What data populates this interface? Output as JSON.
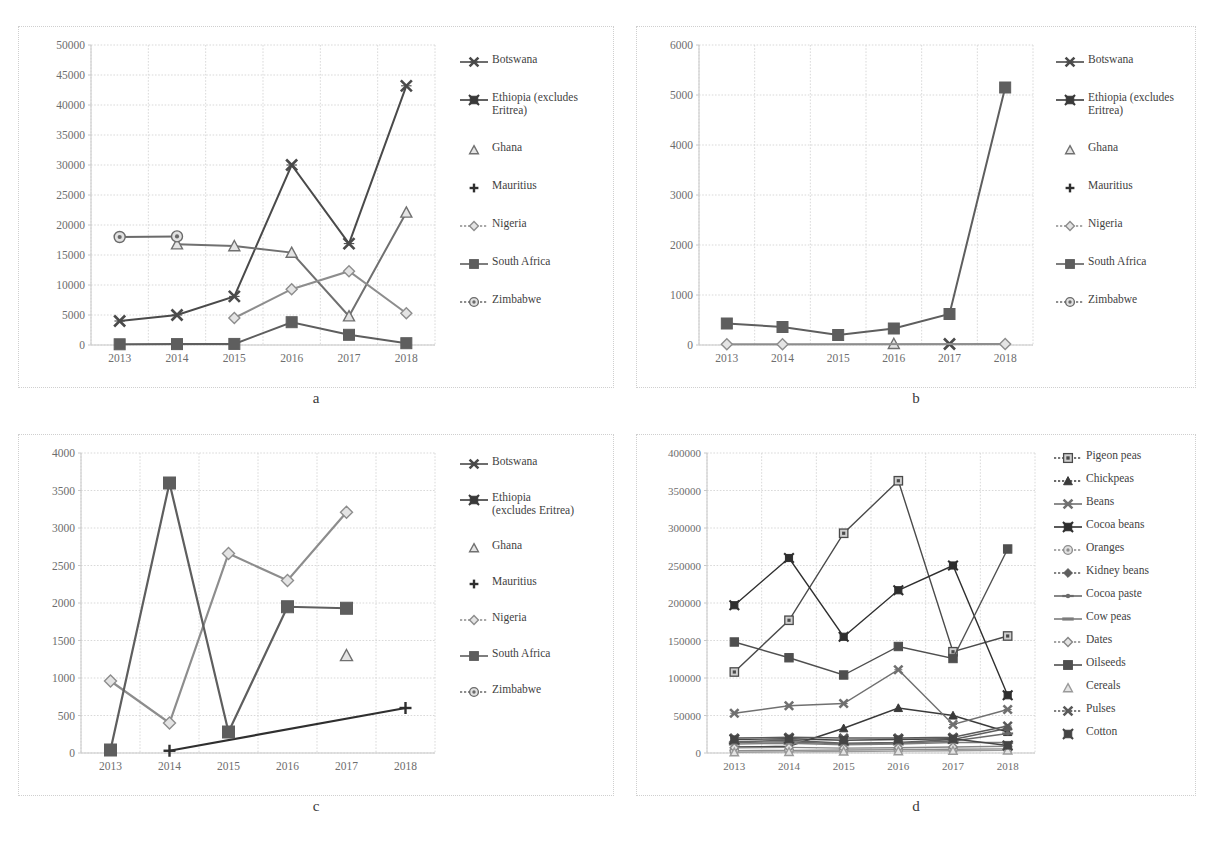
{
  "figure": {
    "panels": [
      {
        "id": "a",
        "caption": "a",
        "chart_data": {
          "type": "line",
          "title": "",
          "xlabel": "",
          "ylabel": "",
          "categories": [
            "2013",
            "2014",
            "2015",
            "2016",
            "2017",
            "2018"
          ],
          "ylim": [
            0,
            50000
          ],
          "yticks": [
            0,
            5000,
            10000,
            15000,
            20000,
            25000,
            30000,
            35000,
            40000,
            45000,
            50000
          ],
          "ytick_labels": [
            "0",
            "5000",
            "10000",
            "15000",
            "20000",
            "25000",
            "30000",
            "35000",
            "40000",
            "45000",
            "50000"
          ],
          "grid": true,
          "legend_position": "right",
          "series": [
            {
              "name": "Botswana",
              "marker": "star-x",
              "values": [
                4000,
                5000,
                8100,
                30000,
                16900,
                43200
              ]
            },
            {
              "name": "Ethiopia (excludes Eritrea)",
              "marker": "star-box",
              "values": [
                null,
                null,
                null,
                null,
                null,
                null
              ]
            },
            {
              "name": "Ghana",
              "marker": "triangle",
              "values": [
                null,
                16800,
                16500,
                15400,
                4800,
                22100
              ]
            },
            {
              "name": "Mauritius",
              "marker": "plus",
              "values": [
                null,
                null,
                null,
                null,
                null,
                null
              ]
            },
            {
              "name": "Nigeria",
              "marker": "diamond",
              "values": [
                null,
                null,
                4500,
                9300,
                12300,
                5300
              ]
            },
            {
              "name": "South Africa",
              "marker": "square",
              "values": [
                120,
                150,
                180,
                3800,
                1700,
                300
              ]
            },
            {
              "name": "Zimbabwe",
              "marker": "circle",
              "values": [
                18000,
                18100,
                null,
                null,
                null,
                null
              ]
            }
          ]
        },
        "legend": [
          {
            "label": "Botswana",
            "marker": "star-x"
          },
          {
            "label": "Ethiopia (excludes\nEritrea)",
            "marker": "star-box"
          },
          {
            "label": "Ghana",
            "marker": "triangle"
          },
          {
            "label": "Mauritius",
            "marker": "plus"
          },
          {
            "label": "Nigeria",
            "marker": "diamond"
          },
          {
            "label": "South Africa",
            "marker": "square"
          },
          {
            "label": "Zimbabwe",
            "marker": "circle"
          }
        ]
      },
      {
        "id": "b",
        "caption": "b",
        "chart_data": {
          "type": "line",
          "title": "",
          "xlabel": "",
          "ylabel": "",
          "categories": [
            "2013",
            "2014",
            "2015",
            "2016",
            "2017",
            "2018"
          ],
          "ylim": [
            0,
            6000
          ],
          "yticks": [
            0,
            1000,
            2000,
            3000,
            4000,
            5000,
            6000
          ],
          "ytick_labels": [
            "0",
            "1000",
            "2000",
            "3000",
            "4000",
            "5000",
            "6000"
          ],
          "grid": true,
          "legend_position": "right",
          "series": [
            {
              "name": "Botswana",
              "marker": "star-x",
              "values": [
                null,
                null,
                null,
                null,
                20,
                null
              ]
            },
            {
              "name": "Ethiopia (excludes Eritrea)",
              "marker": "star-box",
              "values": [
                null,
                null,
                null,
                null,
                null,
                null
              ]
            },
            {
              "name": "Ghana",
              "marker": "triangle",
              "values": [
                null,
                null,
                null,
                25,
                null,
                null
              ]
            },
            {
              "name": "Mauritius",
              "marker": "plus",
              "values": [
                null,
                null,
                null,
                null,
                null,
                null
              ]
            },
            {
              "name": "Nigeria",
              "marker": "diamond",
              "values": [
                15,
                15,
                null,
                null,
                null,
                20
              ]
            },
            {
              "name": "South Africa",
              "marker": "square",
              "values": [
                430,
                360,
                200,
                330,
                620,
                5150
              ]
            },
            {
              "name": "Zimbabwe",
              "marker": "circle",
              "values": [
                null,
                null,
                null,
                null,
                null,
                null
              ]
            }
          ]
        },
        "legend": [
          {
            "label": "Botswana",
            "marker": "star-x"
          },
          {
            "label": "Ethiopia (excludes\nEritrea)",
            "marker": "star-box"
          },
          {
            "label": "Ghana",
            "marker": "triangle"
          },
          {
            "label": "Mauritius",
            "marker": "plus"
          },
          {
            "label": "Nigeria",
            "marker": "diamond"
          },
          {
            "label": "South Africa",
            "marker": "square"
          },
          {
            "label": "Zimbabwe",
            "marker": "circle"
          }
        ]
      },
      {
        "id": "c",
        "caption": "c",
        "chart_data": {
          "type": "line",
          "title": "",
          "xlabel": "",
          "ylabel": "",
          "categories": [
            "2013",
            "2014",
            "2015",
            "2016",
            "2017",
            "2018"
          ],
          "ylim": [
            0,
            4000
          ],
          "yticks": [
            0,
            500,
            1000,
            1500,
            2000,
            2500,
            3000,
            3500,
            4000
          ],
          "ytick_labels": [
            "0",
            "500",
            "1000",
            "1500",
            "2000",
            "2500",
            "3000",
            "3500",
            "4000"
          ],
          "grid": true,
          "legend_position": "right",
          "series": [
            {
              "name": "Botswana",
              "marker": "star-x",
              "values": [
                null,
                null,
                null,
                null,
                null,
                null
              ]
            },
            {
              "name": "Ethiopia (excludes Eritrea)",
              "marker": "star-box",
              "values": [
                null,
                null,
                null,
                null,
                null,
                null
              ]
            },
            {
              "name": "Ghana",
              "marker": "triangle",
              "values": [
                null,
                null,
                null,
                null,
                1300,
                null
              ]
            },
            {
              "name": "Mauritius",
              "marker": "plus",
              "values": [
                null,
                30,
                null,
                null,
                null,
                600
              ]
            },
            {
              "name": "Nigeria",
              "marker": "diamond",
              "values": [
                960,
                400,
                2660,
                2300,
                3210,
                null
              ]
            },
            {
              "name": "South Africa",
              "marker": "square",
              "values": [
                40,
                3600,
                280,
                1950,
                1930,
                null
              ]
            },
            {
              "name": "Zimbabwe",
              "marker": "circle",
              "values": [
                null,
                null,
                null,
                null,
                null,
                null
              ]
            }
          ]
        },
        "legend": [
          {
            "label": "Botswana",
            "marker": "star-x"
          },
          {
            "label": "Ethiopia\n(excludes Eritrea)",
            "marker": "star-box"
          },
          {
            "label": "Ghana",
            "marker": "triangle"
          },
          {
            "label": "Mauritius",
            "marker": "plus"
          },
          {
            "label": "Nigeria",
            "marker": "diamond"
          },
          {
            "label": "South Africa",
            "marker": "square"
          },
          {
            "label": "Zimbabwe",
            "marker": "circle"
          }
        ]
      },
      {
        "id": "d",
        "caption": "d",
        "chart_data": {
          "type": "line",
          "title": "",
          "xlabel": "",
          "ylabel": "",
          "categories": [
            "2013",
            "2014",
            "2015",
            "2016",
            "2017",
            "2018"
          ],
          "ylim": [
            0,
            400000
          ],
          "yticks": [
            0,
            50000,
            100000,
            150000,
            200000,
            250000,
            300000,
            350000,
            400000
          ],
          "ytick_labels": [
            "0",
            "50000",
            "100000",
            "150000",
            "200000",
            "250000",
            "300000",
            "350000",
            "400000"
          ],
          "grid": true,
          "legend_position": "right",
          "series": [
            {
              "name": "Pigeon peas",
              "marker": "square-dot",
              "values": [
                108000,
                177000,
                293000,
                363000,
                135000,
                156000
              ]
            },
            {
              "name": "Chickpeas",
              "marker": "triangle-fill",
              "values": [
                8000,
                9000,
                33000,
                60000,
                50000,
                28000
              ]
            },
            {
              "name": "Beans",
              "marker": "star-x",
              "values": [
                53000,
                63000,
                66000,
                111000,
                38000,
                58000
              ]
            },
            {
              "name": "Cocoa beans",
              "marker": "star-box",
              "values": [
                197000,
                260000,
                155000,
                217000,
                250000,
                77000
              ]
            },
            {
              "name": "Oranges",
              "marker": "circle",
              "values": [
                3000,
                3500,
                4000,
                4500,
                5000,
                5500
              ]
            },
            {
              "name": "Kidney beans",
              "marker": "diamond-fill",
              "values": [
                15000,
                17000,
                13000,
                14000,
                18000,
                33000
              ]
            },
            {
              "name": "Cocoa paste",
              "marker": "dash-fill",
              "values": [
                14000,
                15000,
                12000,
                13000,
                16000,
                26000
              ]
            },
            {
              "name": "Cow peas",
              "marker": "dash",
              "values": [
                12000,
                13000,
                11000,
                12000,
                14000,
                14000
              ]
            },
            {
              "name": "Dates",
              "marker": "diamond",
              "values": [
                7000,
                7500,
                6500,
                7000,
                8000,
                9000
              ]
            },
            {
              "name": "Oilseeds",
              "marker": "square",
              "values": [
                148000,
                127000,
                104000,
                142000,
                126000,
                272000
              ]
            },
            {
              "name": "Cereals",
              "marker": "triangle",
              "values": [
                1000,
                1500,
                2000,
                2500,
                3000,
                3500
              ]
            },
            {
              "name": "Pulses",
              "marker": "star-x2",
              "values": [
                20000,
                21000,
                20000,
                20000,
                21000,
                36000
              ]
            },
            {
              "name": "Cotton",
              "marker": "star-box2",
              "values": [
                18000,
                19000,
                17000,
                18000,
                19000,
                10000
              ]
            }
          ]
        },
        "legend": [
          {
            "label": "Pigeon peas",
            "marker": "square-dot"
          },
          {
            "label": "Chickpeas",
            "marker": "triangle-fill"
          },
          {
            "label": "Beans",
            "marker": "star-x"
          },
          {
            "label": "Cocoa beans",
            "marker": "star-box"
          },
          {
            "label": "Oranges",
            "marker": "circle"
          },
          {
            "label": "Kidney beans",
            "marker": "diamond-fill"
          },
          {
            "label": "Cocoa paste",
            "marker": "dash-fill"
          },
          {
            "label": "Cow peas",
            "marker": "dash"
          },
          {
            "label": "Dates",
            "marker": "diamond"
          },
          {
            "label": "Oilseeds",
            "marker": "square"
          },
          {
            "label": "Cereals",
            "marker": "triangle"
          },
          {
            "label": "Pulses",
            "marker": "star-x2"
          },
          {
            "label": "Cotton",
            "marker": "star-box2"
          }
        ]
      }
    ],
    "colors": {
      "grid": "#d9d9d9",
      "axis": "#c8c8c8",
      "tick_text": "#6d6d6d",
      "caption_text": "#3a3a3a",
      "series_dark": "#3c3c3c",
      "series_mid": "#6e6e6e",
      "series_light": "#a9a9a9",
      "panel_border": "#cfcfcf"
    }
  }
}
